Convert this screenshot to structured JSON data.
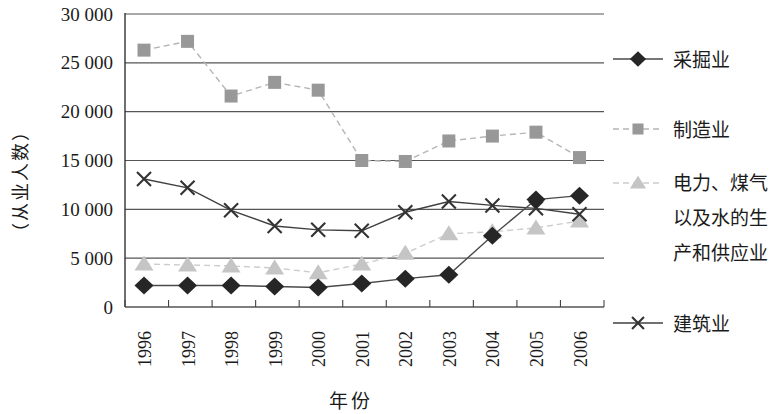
{
  "chart_data": {
    "type": "line",
    "title": "",
    "xlabel": "年份",
    "ylabel": "（从业人数）",
    "categories": [
      "1996",
      "1997",
      "1998",
      "1999",
      "2000",
      "2001",
      "2002",
      "2003",
      "2004",
      "2005",
      "2006"
    ],
    "ylim": [
      0,
      30000
    ],
    "ytick_step": 5000,
    "ytick_labels": [
      "0",
      "5 000",
      "10 000",
      "15 000",
      "20 000",
      "25 000",
      "30 000"
    ],
    "grid": true,
    "legend_position": "right",
    "series": [
      {
        "key": "mining",
        "name": "采掘业",
        "marker": "diamond",
        "marker_color": "#262626",
        "line_color": "#4a4a4a",
        "line_style": "solid",
        "values": [
          2200,
          2200,
          2200,
          2100,
          2000,
          2400,
          2900,
          3300,
          7300,
          11000,
          11400
        ]
      },
      {
        "key": "manufacturing",
        "name": "制造业",
        "marker": "square",
        "marker_color": "#989898",
        "line_color": "#b5b5b5",
        "line_style": "dashed",
        "values": [
          26300,
          27200,
          21600,
          23000,
          22200,
          15000,
          14900,
          17000,
          17500,
          17900,
          15300
        ]
      },
      {
        "key": "utilities",
        "name": "电力、煤气以及水的生产和供应业",
        "marker": "triangle",
        "marker_color": "#c5c5c5",
        "line_color": "#cccccc",
        "line_style": "dashed",
        "values": [
          4400,
          4300,
          4200,
          4000,
          3500,
          4400,
          5500,
          7500,
          7700,
          8100,
          8800
        ]
      },
      {
        "key": "construction",
        "name": "建筑业",
        "marker": "x",
        "marker_color": "#333333",
        "line_color": "#404040",
        "line_style": "solid",
        "values": [
          13100,
          12200,
          9900,
          8300,
          7900,
          7800,
          9700,
          10800,
          10400,
          10100,
          9500
        ]
      }
    ]
  }
}
